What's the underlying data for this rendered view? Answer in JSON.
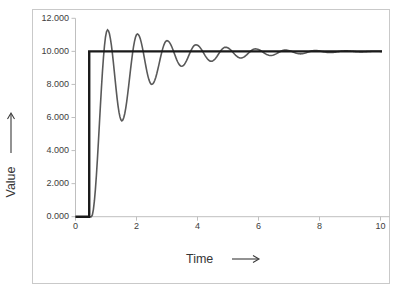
{
  "chart_data": {
    "type": "line",
    "title": "",
    "xlabel": "Time",
    "ylabel": "Value",
    "xlim": [
      0,
      10.3
    ],
    "ylim": [
      0,
      12
    ],
    "grid": false,
    "legend": "none",
    "x_ticks": [
      {
        "value": 0,
        "label": "0"
      },
      {
        "value": 2,
        "label": "2"
      },
      {
        "value": 4,
        "label": "4"
      },
      {
        "value": 6,
        "label": "6"
      },
      {
        "value": 8,
        "label": "8"
      },
      {
        "value": 10,
        "label": "10"
      }
    ],
    "y_ticks": [
      {
        "value": 0,
        "label": "0.000"
      },
      {
        "value": 2,
        "label": "2.000"
      },
      {
        "value": 4,
        "label": "4.000"
      },
      {
        "value": 6,
        "label": "6.000"
      },
      {
        "value": 8,
        "label": "8.000"
      },
      {
        "value": 10,
        "label": "10.000"
      },
      {
        "value": 12,
        "label": "12.000"
      }
    ],
    "series": [
      {
        "name": "step-input",
        "shape": "step",
        "color": "#1a1a1a",
        "width": 2.4,
        "points": [
          [
            0,
            0
          ],
          [
            0.45,
            0
          ],
          [
            0.45,
            10
          ],
          [
            10.05,
            10
          ]
        ]
      },
      {
        "name": "oscillatory-response",
        "shape": "damped-oscillation",
        "color": "#595959",
        "width": 1.6,
        "interpolation": "half-cosine-through-extrema",
        "extrema": [
          [
            0,
            0
          ],
          [
            0.52,
            0
          ],
          [
            1.05,
            11.3
          ],
          [
            1.52,
            5.8
          ],
          [
            2.03,
            11.05
          ],
          [
            2.5,
            8.0
          ],
          [
            3.0,
            10.65
          ],
          [
            3.48,
            9.1
          ],
          [
            3.95,
            10.4
          ],
          [
            4.45,
            9.4
          ],
          [
            4.92,
            10.25
          ],
          [
            5.42,
            9.6
          ],
          [
            5.9,
            10.15
          ],
          [
            6.4,
            9.75
          ],
          [
            6.88,
            10.08
          ],
          [
            7.38,
            9.85
          ],
          [
            7.85,
            10.05
          ],
          [
            8.35,
            9.93
          ],
          [
            8.85,
            10.03
          ],
          [
            9.35,
            9.97
          ],
          [
            9.85,
            10.01
          ],
          [
            10.05,
            10.0
          ]
        ]
      }
    ],
    "style": {
      "background": "#ffffff",
      "frame_border_color": "#c9c9c9",
      "axis_color": "#bfbfbf",
      "tick_label_color": "#3d3d3d",
      "title_color": "#363636",
      "step_color": "#1a1a1a",
      "response_color": "#595959"
    }
  }
}
